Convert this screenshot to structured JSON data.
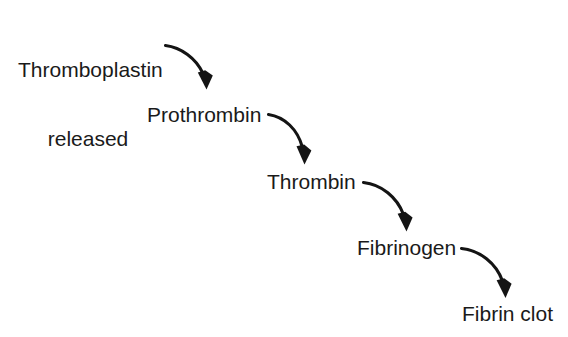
{
  "diagram": {
    "background_color": "#ffffff",
    "text_color": "#1a1a1a",
    "arrow_color": "#141414",
    "nodes": [
      {
        "id": "thromboplastin-released",
        "label_line1": "Thromboplastin",
        "label_line2": "released",
        "label": "Thromboplastin released"
      },
      {
        "id": "prothrombin",
        "label": "Prothrombin"
      },
      {
        "id": "thrombin",
        "label": "Thrombin"
      },
      {
        "id": "fibrinogen",
        "label": "Fibrinogen"
      },
      {
        "id": "fibrin-clot",
        "label": "Fibrin clot"
      }
    ],
    "edges": [
      {
        "id": "edge-1",
        "from": "thromboplastin-released",
        "to": "prothrombin"
      },
      {
        "id": "edge-2",
        "from": "prothrombin",
        "to": "thrombin"
      },
      {
        "id": "edge-3",
        "from": "thrombin",
        "to": "fibrinogen"
      },
      {
        "id": "edge-4",
        "from": "fibrinogen",
        "to": "fibrin-clot"
      }
    ]
  }
}
